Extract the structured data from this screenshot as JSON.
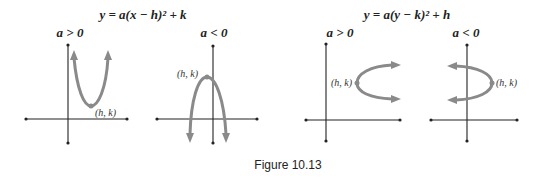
{
  "figure": {
    "caption": "Figure 10.13",
    "colors": {
      "curve": "#8a8a8a",
      "axis": "#222222",
      "text": "#222222"
    },
    "groups": [
      {
        "equation": "y = a(x − h)² + k",
        "panels": [
          {
            "condition": "a > 0",
            "vertex_label": "(h, k)",
            "opens": "up"
          },
          {
            "condition": "a < 0",
            "vertex_label": "(h, k)",
            "opens": "down"
          }
        ]
      },
      {
        "equation": "y = a(y − k)² + h",
        "panels": [
          {
            "condition": "a > 0",
            "vertex_label": "(h, k)",
            "opens": "right"
          },
          {
            "condition": "a < 0",
            "vertex_label": "(h, k)",
            "opens": "left"
          }
        ]
      }
    ]
  }
}
